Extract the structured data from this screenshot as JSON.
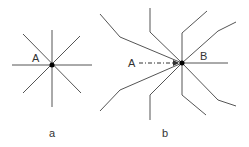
{
  "figure_a": {
    "caption": "a",
    "point_label": "A",
    "description": "eight straight lines radiating from point A"
  },
  "figure_b": {
    "caption": "b",
    "point_label_start": "A",
    "point_label_end": "B",
    "description": "bent polylines converging to point B, with a dash-dot arrow from A to B"
  },
  "colors": {
    "line": "#555555",
    "point": "#000000",
    "text": "#333333"
  }
}
